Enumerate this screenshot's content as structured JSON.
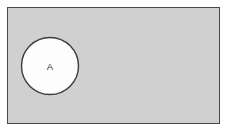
{
  "diagram": {
    "type": "venn-diagram",
    "title": "",
    "universal_set": {
      "name": "universal-set-rectangle",
      "label": "",
      "shape": "rectangle",
      "x": 7.5,
      "y": 7.5,
      "width": 212,
      "height": 116,
      "fill_color": "#d0d0d0",
      "stroke_color": "#4a4a4a",
      "stroke_width": 1
    },
    "sets": [
      {
        "name": "set-a-circle",
        "label": "A",
        "shape": "circle",
        "cx": 50,
        "cy": 66,
        "r": 28.5,
        "fill_color": "#fdfdfd",
        "stroke_color": "#3c3c3c",
        "stroke_width": 1.4,
        "label_x": 50,
        "label_y": 66.5,
        "label_color": "#3a3a3a"
      }
    ],
    "background_color": "#ffffff"
  },
  "chart_data": {
    "type": "diagram",
    "subtype": "venn",
    "title": "",
    "regions": [
      {
        "label": "A",
        "shape": "circle",
        "shaded": false
      },
      {
        "label": "",
        "shape": "rectangle",
        "shaded": true
      }
    ],
    "labels": [
      "A"
    ],
    "legend": []
  }
}
